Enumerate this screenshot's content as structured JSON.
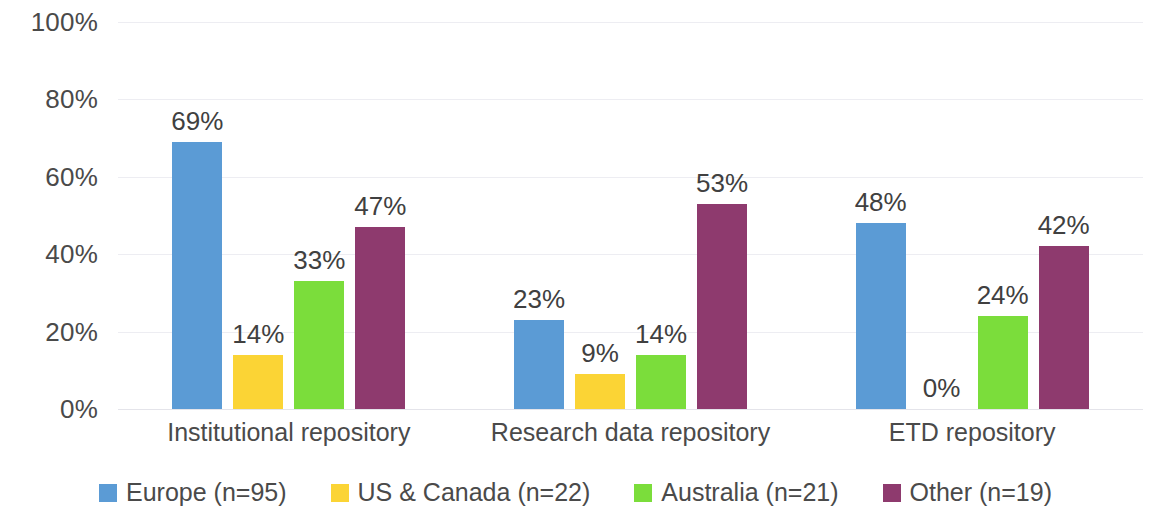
{
  "chart_data": {
    "type": "bar",
    "title": "",
    "subtitle": "",
    "xlabel": "",
    "ylabel": "",
    "grid": true,
    "legend_position": "bottom",
    "ylim": [
      0,
      100
    ],
    "y_ticks": [
      "0%",
      "20%",
      "40%",
      "60%",
      "80%",
      "100%"
    ],
    "y_tick_values": [
      0,
      20,
      40,
      60,
      80,
      100
    ],
    "categories": [
      "Institutional repository",
      "Research data repository",
      "ETD repository"
    ],
    "series": [
      {
        "name": "Europe (n=95)",
        "color": "#5B9BD5",
        "values": [
          69,
          23,
          48
        ],
        "labels": [
          "69%",
          "23%",
          "48%"
        ]
      },
      {
        "name": "US & Canada (n=22)",
        "color": "#FBD435",
        "values": [
          14,
          9,
          0
        ],
        "labels": [
          "14%",
          "9%",
          "0%"
        ]
      },
      {
        "name": "Australia (n=21)",
        "color": "#7BDD3B",
        "values": [
          33,
          14,
          24
        ],
        "labels": [
          "33%",
          "14%",
          "24%"
        ]
      },
      {
        "name": "Other (n=19)",
        "color": "#8E3A6E",
        "values": [
          47,
          53,
          42
        ],
        "labels": [
          "47%",
          "53%",
          "42%"
        ]
      }
    ]
  },
  "axis": {
    "y_labels": [
      "100%",
      "80%",
      "60%",
      "40%",
      "20%",
      "0%"
    ]
  },
  "legend": {
    "items": [
      {
        "label": "Europe (n=95)",
        "color": "#5B9BD5"
      },
      {
        "label": "US & Canada (n=22)",
        "color": "#FBD435"
      },
      {
        "label": "Australia (n=21)",
        "color": "#7BDD3B"
      },
      {
        "label": "Other (n=19)",
        "color": "#8E3A6E"
      }
    ]
  },
  "colors": {
    "grid": "#ededf2",
    "text": "#4a4a4a",
    "data_label": "#404040",
    "background": "#ffffff"
  }
}
